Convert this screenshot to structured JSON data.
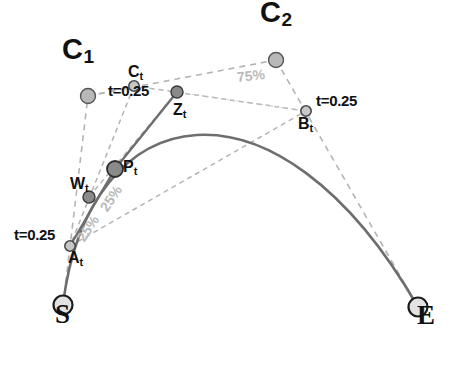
{
  "figure": {
    "title_visible": false,
    "background": "#ffffff",
    "width": 452,
    "height": 369
  },
  "colors": {
    "curve": "#6e6e6e",
    "hull_dashed": "#b4b4b4",
    "helper_dashed": "#c9c9c9",
    "control_point_fill": "#b8b8b8",
    "control_point_stroke": "#555555",
    "t_point_fill": "#c8c8c8",
    "t_point_stroke": "#4a4a4a",
    "interp_point_fill": "#8a8a8a",
    "interp_point_stroke": "#3a3a3a",
    "endpoint_fill": "#e2e2e2",
    "endpoint_stroke": "#1c1c1c",
    "label_text": "#111111",
    "percent_text": "#b9b9b9"
  },
  "chart_data": {
    "type": "diagram",
    "subtype": "cubic-bezier-de-casteljau-construction",
    "parameter": "t=0.25",
    "points": [
      {
        "id": "S",
        "label": "S",
        "x": 63,
        "y": 305,
        "kind": "endpoint",
        "label_dx": -8,
        "label_dy": 15
      },
      {
        "id": "E",
        "label": "E",
        "x": 418,
        "y": 307,
        "kind": "endpoint",
        "label_dx": -1,
        "label_dy": 14
      },
      {
        "id": "C1",
        "label": "C",
        "sub": "1",
        "x": 88,
        "y": 96,
        "kind": "control",
        "label_dx": -26,
        "label_dy": -40
      },
      {
        "id": "C2",
        "label": "C",
        "sub": "2",
        "x": 276,
        "y": 60,
        "kind": "control",
        "label_dx": -16,
        "label_dy": -41
      },
      {
        "id": "At",
        "label": "A",
        "sub": "t",
        "x": 70,
        "y": 246,
        "kind": "tpoint",
        "label_dx": -2,
        "label_dy": 16
      },
      {
        "id": "Bt",
        "label": "B",
        "sub": "t",
        "x": 306,
        "y": 111,
        "kind": "tpoint",
        "label_dx": -8,
        "label_dy": 17
      },
      {
        "id": "Ct",
        "label": "C",
        "sub": "t",
        "x": 134,
        "y": 86,
        "kind": "tpoint",
        "label_dx": -6,
        "label_dy": -10
      },
      {
        "id": "Wt",
        "label": "W",
        "sub": "t",
        "x": 89,
        "y": 197,
        "kind": "interp",
        "label_dx": -19,
        "label_dy": -9
      },
      {
        "id": "Zt",
        "label": "Z",
        "sub": "t",
        "x": 177,
        "y": 92,
        "kind": "interp",
        "label_dx": -4,
        "label_dy": 22
      },
      {
        "id": "Pt",
        "label": "P",
        "sub": "t",
        "x": 115,
        "y": 169,
        "kind": "result",
        "label_dx": 8,
        "label_dy": 2
      }
    ],
    "bezier": {
      "start": [
        63,
        305
      ],
      "control1": [
        88,
        96
      ],
      "control2": [
        276,
        60
      ],
      "end": [
        418,
        307
      ]
    },
    "hull_segments": [
      {
        "name": "S-C1",
        "from": "S",
        "to": "C1"
      },
      {
        "name": "C1-C2",
        "from": "C1",
        "to": "C2"
      },
      {
        "name": "C2-E",
        "from": "C2",
        "to": "E"
      }
    ],
    "construction_segments": [
      {
        "name": "At-Bt",
        "from": "At",
        "to": "Bt"
      },
      {
        "name": "Bt-Ct",
        "from": "Bt",
        "to": "Ct"
      },
      {
        "name": "Ct-At",
        "from": "Ct",
        "to": "At"
      },
      {
        "name": "Wt-Zt",
        "from": "Wt",
        "to": "Zt"
      }
    ],
    "percent_labels": [
      {
        "id": "pct-75",
        "text": "75%",
        "x": 237,
        "y": 80,
        "rotate": -6,
        "tone": "light"
      },
      {
        "id": "pct-25-outer",
        "text": "25%",
        "x": 80,
        "y": 243,
        "rotate": -56,
        "tone": "light"
      },
      {
        "id": "pct-25-inner",
        "text": "25%",
        "x": 103,
        "y": 213,
        "rotate": -56,
        "tone": "light"
      }
    ],
    "t_labels": [
      {
        "id": "t-label-ct",
        "text": "t=0.25",
        "x": 108,
        "y": 94,
        "anchor": "start"
      },
      {
        "id": "t-label-bt",
        "text": "t=0.25",
        "x": 316,
        "y": 104,
        "anchor": "start"
      },
      {
        "id": "t-label-at",
        "text": "t=0.25",
        "x": 14,
        "y": 238,
        "anchor": "start"
      }
    ]
  }
}
